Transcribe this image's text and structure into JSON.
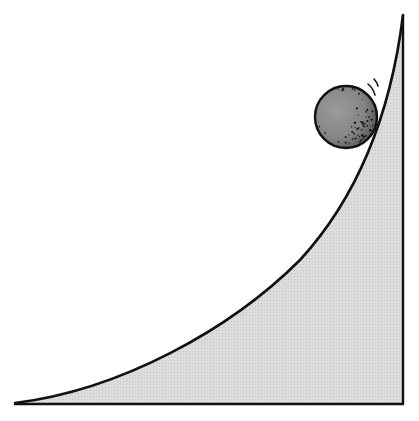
{
  "illustration": {
    "subject": "ball rolling up a curved ramp",
    "colors": {
      "background": "#ffffff",
      "ramp_fill": "#d9d9d9",
      "outline": "#111111",
      "ball_fill": "#8a8a8a",
      "ball_shade": "#2a2a2a"
    }
  }
}
